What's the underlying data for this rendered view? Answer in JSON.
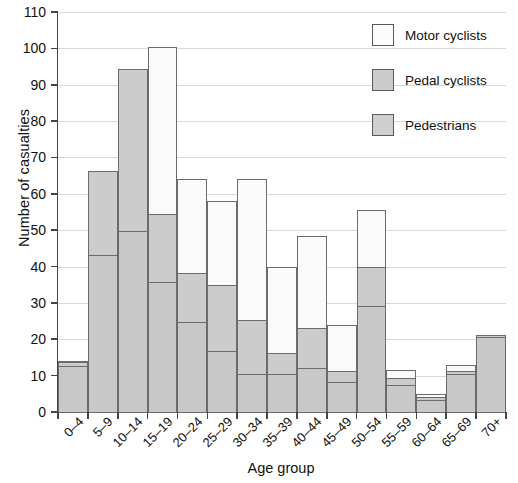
{
  "chart_data": {
    "type": "bar",
    "subtype": "stacked-bar",
    "title": "",
    "xlabel": "Age group",
    "ylabel": "Number of casualties",
    "ylim": [
      0,
      110
    ],
    "ytick_step": 10,
    "yticks": [
      0,
      10,
      20,
      30,
      40,
      50,
      60,
      70,
      80,
      90,
      100,
      110
    ],
    "grid": "horizontal",
    "legend_position": "top-right",
    "categories": [
      "0–4",
      "5–9",
      "10–14",
      "15–19",
      "20–24",
      "25–29",
      "30–34",
      "35–39",
      "40–44",
      "45–49",
      "50–54",
      "55–59",
      "60–64",
      "65–69",
      "70+"
    ],
    "series": [
      {
        "name": "Pedestrians",
        "color": "#c8c8c8",
        "values": [
          13,
          43.5,
          50,
          36,
          25,
          17,
          10.8,
          10.8,
          12.5,
          8.5,
          29.5,
          7.8,
          3.5,
          10.8,
          21
        ]
      },
      {
        "name": "Pedal cyclists",
        "color": "#cccccc",
        "values": [
          1.5,
          23.5,
          45,
          19,
          14,
          18.5,
          15.2,
          6.2,
          11.3,
          3.5,
          11,
          2.2,
          1.3,
          1.2,
          0.8
        ]
      },
      {
        "name": "Motor cyclists",
        "color": "#fafafa",
        "values": [
          0.5,
          0,
          0,
          46.5,
          26,
          23.5,
          39,
          24,
          25.7,
          13,
          16,
          2.5,
          1.2,
          1.8,
          0
        ]
      }
    ],
    "totals": [
      15,
      67,
      95,
      101.5,
      65,
      59,
      65,
      41,
      49.5,
      25,
      56.5,
      12.5,
      6,
      13.8,
      21.8
    ],
    "stack_boundaries": [
      [
        13,
        14.5,
        15
      ],
      [
        43.5,
        67,
        67
      ],
      [
        50,
        95,
        95
      ],
      [
        36,
        55,
        101.5
      ],
      [
        25,
        39,
        65
      ],
      [
        17,
        35.5,
        59
      ],
      [
        10.8,
        26,
        65
      ],
      [
        10.8,
        17,
        41
      ],
      [
        12.5,
        23.8,
        49.5
      ],
      [
        8.5,
        12,
        25
      ],
      [
        29.5,
        40.5,
        56.5
      ],
      [
        7.8,
        10,
        12.5
      ],
      [
        3.5,
        4.8,
        6
      ],
      [
        10.8,
        12,
        13.8
      ],
      [
        21,
        21.8,
        21.8
      ]
    ]
  },
  "legend": {
    "items": [
      {
        "label": "Motor cyclists",
        "swatch": "motor"
      },
      {
        "label": "Pedal cyclists",
        "swatch": "pedal"
      },
      {
        "label": "Pedestrians",
        "swatch": "ped"
      }
    ]
  },
  "axes": {
    "y_title": "Number of casualties",
    "x_title": "Age group"
  },
  "colors": {
    "motor_cyclists": "#fafafa",
    "pedal_cyclists": "#cccccc",
    "pedestrians": "#c8c8c8",
    "bar_outline": "#6b6b6b",
    "axis": "#444444",
    "gridline": "#d8d8d8",
    "background": "#ffffff"
  }
}
